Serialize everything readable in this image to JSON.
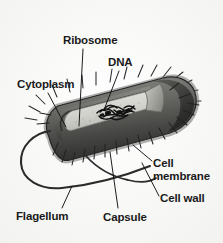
{
  "figure": {
    "style": "grayscale-textbook-illustration",
    "background_color": "#fbfbfb",
    "label_color": "#1a1a1a",
    "leader_line_color": "#111111",
    "colors": {
      "capsule_outer": "#6f6f6f",
      "cell_wall": "#4a4a4a",
      "cell_membrane": "#3a3a3a",
      "cytoplasm": "#d6d6d2",
      "cut_face": "#9a9a96",
      "dna": "#111111",
      "pili": "#2b2b2b",
      "flagellum": "#2b2b2b",
      "right_cap_dark": "#3c3c3c"
    }
  },
  "labels": {
    "ribosome": "Ribosome",
    "dna": "DNA",
    "cytoplasm": "Cytoplasm",
    "cell_membrane": "Cell\nmembrane",
    "cell_wall": "Cell wall",
    "flagellum": "Flagellum",
    "capsule": "Capsule"
  },
  "parts": [
    {
      "name": "ribosome",
      "label": "Ribosome",
      "leader": "from label down-right into cytoplasm"
    },
    {
      "name": "dna",
      "label": "DNA",
      "leader": "from label down-left into nucleoid cluster"
    },
    {
      "name": "cytoplasm",
      "label": "Cytoplasm",
      "leader": "from label down-right into cell interior"
    },
    {
      "name": "cell-membrane",
      "label": "Cell membrane",
      "leader": "from label up-left to inner envelope layer"
    },
    {
      "name": "cell-wall",
      "label": "Cell wall",
      "leader": "from label up-left to middle envelope layer"
    },
    {
      "name": "flagellum",
      "label": "Flagellum",
      "leader": "from label up-right to looping tail"
    },
    {
      "name": "capsule",
      "label": "Capsule",
      "leader": "from label up to outer envelope layer"
    }
  ]
}
